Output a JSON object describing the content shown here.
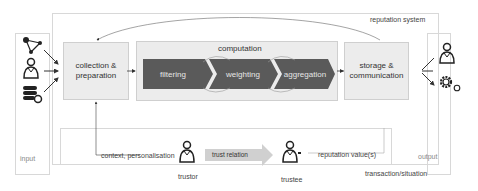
{
  "diagram": {
    "system_label": "reputation system",
    "input_label": "input",
    "output_label": "output",
    "collection_box": "collection & preparation",
    "computation": {
      "title": "computation",
      "steps": [
        "filtering",
        "weighting",
        "aggregation"
      ]
    },
    "storage_box": "storage & communication",
    "context_label": "context, personalisation",
    "trust_relation_label": "trust relation",
    "reputation_values_label": "reputation value(s)",
    "transaction_label": "transaction/situation",
    "trustor_label": "trustor",
    "trustee_label": "trustee",
    "input_icons": [
      "network-graph-icon",
      "user-icon",
      "database-gear-icon"
    ],
    "output_icons": [
      "user-icon",
      "gears-icon"
    ],
    "colors": {
      "chevron": "#5a5a5a",
      "box_fill": "#ececec",
      "frame": "#d8d8d8",
      "arrow_fill": "#d0d0d0"
    }
  }
}
